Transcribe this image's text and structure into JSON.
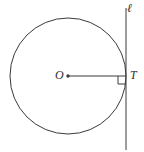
{
  "figure": {
    "name": "circle-with-tangent-line",
    "type": "geometry-diagram",
    "width": 144,
    "height": 152,
    "background_color": "#ffffff",
    "stroke_color": "#3a3a3a",
    "label_color": "#2f2f2f"
  },
  "labels": {
    "center": "O",
    "tangent_point": "T",
    "line": "ℓ"
  },
  "geometry": {
    "circle": {
      "name": "circle",
      "center_x": 68,
      "center_y": 76,
      "radius": 58
    },
    "center_point": {
      "name": "center-point-O",
      "x": 68,
      "y": 76,
      "dot_radius": 1.7
    },
    "tangent_point": {
      "name": "tangent-point-T",
      "x": 126,
      "y": 76
    },
    "tangent_line": {
      "name": "tangent-line-ell",
      "x": 126,
      "y_top": 8,
      "y_bottom": 150
    },
    "radius_segment": {
      "name": "radius-segment-OT",
      "x1": 68,
      "y1": 76,
      "x2": 126,
      "y2": 76
    },
    "right_angle_mark": {
      "name": "right-angle-mark-at-T",
      "size": 8,
      "corner_x": 126,
      "corner_y": 76,
      "direction": "down-left",
      "path": "M 118 76 L 118 84 L 126 84"
    }
  }
}
